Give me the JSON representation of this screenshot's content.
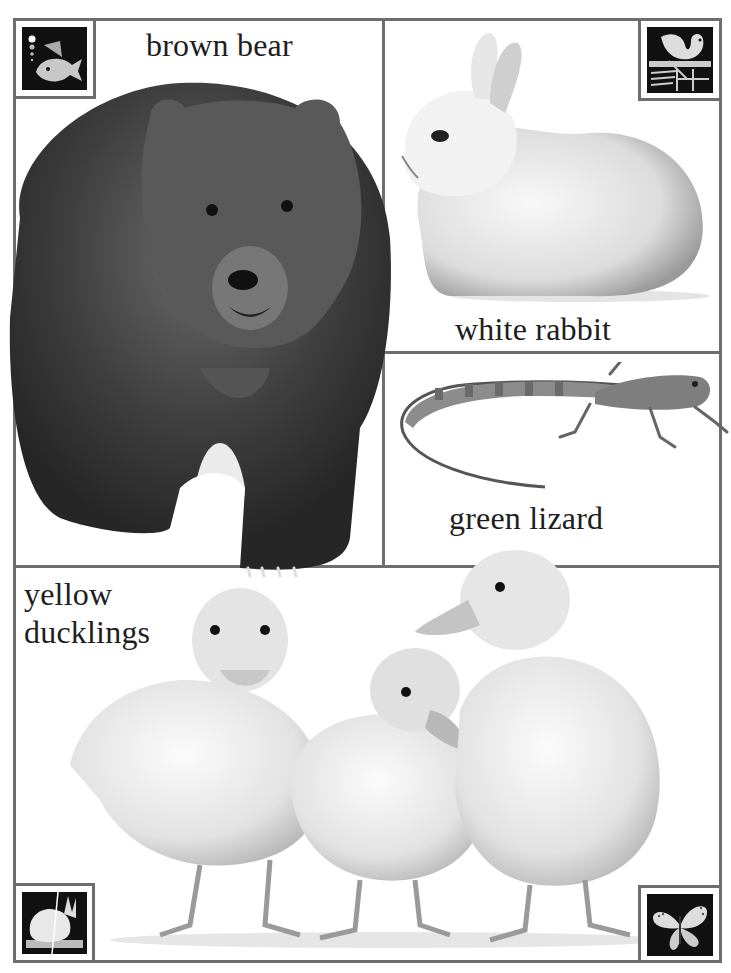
{
  "page": {
    "background": "#ffffff",
    "frame_color": "#6e6e6e",
    "text_color": "#1e1e1e"
  },
  "panels": [
    {
      "id": "bear",
      "label": "brown bear",
      "icon": "fish-icon"
    },
    {
      "id": "rabbit",
      "label": "white rabbit",
      "icon": "swan-icon"
    },
    {
      "id": "lizard",
      "label": "green lizard",
      "icon": null
    },
    {
      "id": "ducklings",
      "label_lines": [
        "yellow",
        "ducklings"
      ],
      "icons": [
        "rabbit-icon",
        "butterfly-icon"
      ]
    }
  ]
}
